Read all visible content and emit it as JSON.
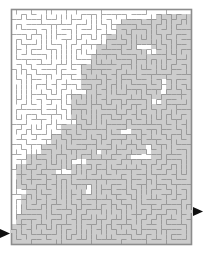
{
  "puzzle": {
    "type": "maze",
    "title": "Rectangular maze with highlighted solution region",
    "width_px": 205,
    "height_px": 254
  },
  "colors": {
    "background": "#ffffff",
    "wall": "#a9a9a9",
    "border": "#8c8c8c",
    "passage": "#ffffff",
    "highlight": "#cccccc",
    "highlight_wall": "#9a9a9a",
    "arrow": "#101010"
  },
  "grid": {
    "origin_x": 11,
    "origin_y": 9,
    "cell": 5,
    "cols": 36,
    "rows": 47,
    "wall_thickness": 1,
    "border_thickness": 1.6
  },
  "entrance": {
    "label": "entrance-arrow",
    "side": "left",
    "x": 0,
    "y": 228,
    "width": 11,
    "height": 11,
    "direction": "right",
    "cell_row": 44
  },
  "exit": {
    "label": "exit-arrow",
    "side": "right",
    "x": 193,
    "y": 206,
    "width": 11,
    "height": 11,
    "direction": "right",
    "cell_row": 40
  },
  "highlight_regions": [
    [
      22,
      2,
      5,
      3
    ],
    [
      21,
      3,
      7,
      4
    ],
    [
      19,
      5,
      6,
      3
    ],
    [
      24,
      4,
      7,
      3
    ],
    [
      28,
      4,
      8,
      4
    ],
    [
      30,
      7,
      6,
      4
    ],
    [
      17,
      7,
      5,
      4
    ],
    [
      16,
      9,
      6,
      4
    ],
    [
      14,
      11,
      6,
      5
    ],
    [
      19,
      10,
      4,
      6
    ],
    [
      22,
      8,
      5,
      5
    ],
    [
      25,
      9,
      4,
      5
    ],
    [
      27,
      10,
      4,
      4
    ],
    [
      20,
      14,
      6,
      5
    ],
    [
      15,
      15,
      6,
      5
    ],
    [
      12,
      17,
      6,
      5
    ],
    [
      23,
      12,
      5,
      6
    ],
    [
      26,
      13,
      4,
      5
    ],
    [
      24,
      16,
      4,
      5
    ],
    [
      18,
      19,
      6,
      5
    ],
    [
      13,
      21,
      7,
      5
    ],
    [
      10,
      23,
      6,
      5
    ],
    [
      21,
      18,
      5,
      5
    ],
    [
      22,
      20,
      5,
      4
    ],
    [
      8,
      25,
      6,
      5
    ],
    [
      6,
      27,
      6,
      5
    ],
    [
      3,
      29,
      6,
      5
    ],
    [
      1,
      31,
      6,
      5
    ],
    [
      11,
      26,
      6,
      4
    ],
    [
      14,
      24,
      5,
      4
    ],
    [
      17,
      23,
      5,
      4
    ],
    [
      3,
      33,
      6,
      4
    ],
    [
      5,
      35,
      7,
      4
    ],
    [
      9,
      33,
      6,
      4
    ],
    [
      12,
      31,
      6,
      4
    ],
    [
      15,
      29,
      6,
      4
    ],
    [
      18,
      27,
      6,
      4
    ],
    [
      21,
      25,
      6,
      4
    ],
    [
      24,
      23,
      6,
      4
    ],
    [
      26,
      21,
      6,
      4
    ],
    [
      28,
      19,
      6,
      4
    ],
    [
      30,
      17,
      6,
      5
    ],
    [
      31,
      13,
      5,
      6
    ],
    [
      29,
      8,
      6,
      6
    ],
    [
      26,
      2,
      5,
      4
    ],
    [
      29,
      1,
      7,
      4
    ],
    [
      30,
      22,
      6,
      6
    ],
    [
      28,
      26,
      8,
      6
    ],
    [
      24,
      30,
      12,
      5
    ],
    [
      16,
      33,
      20,
      4
    ],
    [
      8,
      37,
      28,
      4
    ],
    [
      1,
      41,
      35,
      5
    ],
    [
      1,
      44,
      35,
      3
    ],
    [
      0,
      43,
      8,
      4
    ],
    [
      33,
      10,
      3,
      6
    ],
    [
      32,
      5,
      4,
      5
    ],
    [
      2,
      37,
      7,
      4
    ],
    [
      20,
      30,
      6,
      4
    ],
    [
      17,
      31,
      6,
      4
    ]
  ],
  "legend": {
    "entrance_text": "",
    "exit_text": ""
  }
}
